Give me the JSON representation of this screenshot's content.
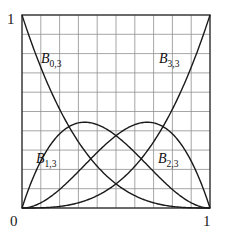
{
  "figure": {
    "name": "cubic-bernstein-basis-plot",
    "frame": {
      "x0": 22,
      "y0": 15,
      "x1": 210,
      "y1": 208
    },
    "grid": {
      "columns": 10,
      "rows": 10,
      "color": "#8c8c8c",
      "frame_color": "#3a3a3a"
    },
    "curve_color": "#1a1a1a"
  },
  "axes": {
    "y_top_label": "1",
    "x_zero_label": "0",
    "x_one_label": "1"
  },
  "labels": {
    "b03": {
      "base": "B",
      "sub": "0,3"
    },
    "b13": {
      "base": "B",
      "sub": "1,3"
    },
    "b23": {
      "base": "B",
      "sub": "2,3"
    },
    "b33": {
      "base": "B",
      "sub": "3,3"
    }
  },
  "chart_data": {
    "type": "line",
    "title": "",
    "xlabel": "",
    "ylabel": "",
    "xlim": [
      0,
      1
    ],
    "ylim": [
      0,
      1
    ],
    "xticks": [
      0,
      1
    ],
    "yticks": [
      1
    ],
    "grid": true,
    "grid_divisions": {
      "x": 10,
      "y": 10
    },
    "legend_position": "inline-annotations",
    "x": [
      0,
      0.05,
      0.1,
      0.15,
      0.2,
      0.25,
      0.3,
      0.3333,
      0.35,
      0.4,
      0.45,
      0.5,
      0.55,
      0.6,
      0.65,
      0.6667,
      0.7,
      0.75,
      0.8,
      0.85,
      0.9,
      0.95,
      1
    ],
    "series": [
      {
        "name": "B0,3",
        "formula": "(1-t)^3",
        "annotation": "B0,3",
        "values": [
          1.0,
          0.857,
          0.729,
          0.614,
          0.512,
          0.422,
          0.343,
          0.296,
          0.275,
          0.216,
          0.166,
          0.125,
          0.091,
          0.064,
          0.043,
          0.037,
          0.027,
          0.016,
          0.008,
          0.003,
          0.001,
          0.0,
          0.0
        ]
      },
      {
        "name": "B1,3",
        "formula": "3t(1-t)^2",
        "annotation": "B1,3",
        "peak": {
          "x": 0.3333,
          "y": 0.4444
        },
        "values": [
          0.0,
          0.135,
          0.243,
          0.325,
          0.384,
          0.422,
          0.441,
          0.444,
          0.444,
          0.432,
          0.408,
          0.375,
          0.334,
          0.288,
          0.239,
          0.222,
          0.189,
          0.141,
          0.096,
          0.057,
          0.027,
          0.007,
          0.0
        ]
      },
      {
        "name": "B2,3",
        "formula": "3t^2(1-t)",
        "annotation": "B2,3",
        "peak": {
          "x": 0.6667,
          "y": 0.4444
        },
        "values": [
          0.0,
          0.007,
          0.027,
          0.057,
          0.096,
          0.141,
          0.189,
          0.222,
          0.239,
          0.288,
          0.334,
          0.375,
          0.408,
          0.432,
          0.444,
          0.444,
          0.441,
          0.422,
          0.384,
          0.325,
          0.243,
          0.135,
          0.0
        ]
      },
      {
        "name": "B3,3",
        "formula": "t^3",
        "annotation": "B3,3",
        "values": [
          0.0,
          0.0,
          0.001,
          0.003,
          0.008,
          0.016,
          0.027,
          0.037,
          0.043,
          0.064,
          0.091,
          0.125,
          0.166,
          0.216,
          0.275,
          0.296,
          0.343,
          0.422,
          0.512,
          0.614,
          0.729,
          0.857,
          1.0
        ]
      }
    ],
    "annotations": [
      {
        "text": "B0,3",
        "x": 0.13,
        "y": 0.74
      },
      {
        "text": "B3,3",
        "x": 0.76,
        "y": 0.74
      },
      {
        "text": "B1,3",
        "x": 0.1,
        "y": 0.24
      },
      {
        "text": "B2,3",
        "x": 0.75,
        "y": 0.24
      }
    ]
  }
}
